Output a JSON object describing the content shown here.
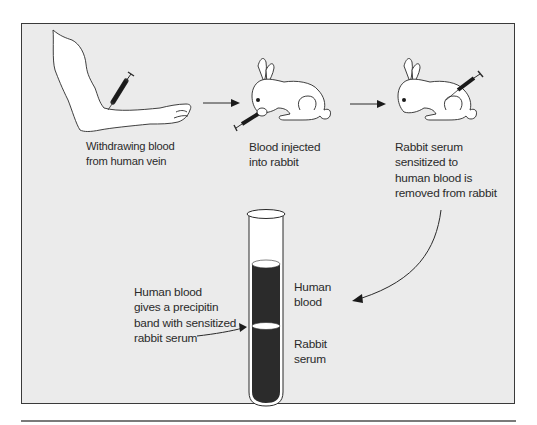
{
  "diagram": {
    "colors": {
      "panel_background": "#ebebeb",
      "panel_border": "#3a3a3a",
      "figure_fill": "#ffffff",
      "line": "#2a2a2a",
      "tube_liquid": "#2b2b2b",
      "bottom_rule": "#7a7a7a"
    },
    "steps": [
      {
        "id": "step1",
        "figure": "human-arm-with-syringe",
        "caption": "Withdrawing blood\nfrom human vein"
      },
      {
        "id": "step2",
        "figure": "rabbit-being-injected",
        "caption": "Blood injected\ninto rabbit"
      },
      {
        "id": "step3",
        "figure": "rabbit-serum-removed",
        "caption": "Rabbit serum\nsensitized to\nhuman blood is\nremoved from rabbit"
      }
    ],
    "arrows": [
      {
        "from": "step1",
        "to": "step2",
        "shape": "straight"
      },
      {
        "from": "step2",
        "to": "step3",
        "shape": "straight"
      },
      {
        "from": "step3",
        "to": "test-tube",
        "shape": "curved"
      },
      {
        "from": "precipitin-label",
        "to": "precipitin-band",
        "shape": "curved"
      }
    ],
    "test_tube": {
      "layers": [
        {
          "label": "Human\nblood",
          "position": "upper"
        },
        {
          "label": "Rabbit\nserum",
          "position": "lower"
        }
      ],
      "band_label": "Human blood\ngives a precipitin\nband with sensitized\nrabbit serum"
    }
  }
}
